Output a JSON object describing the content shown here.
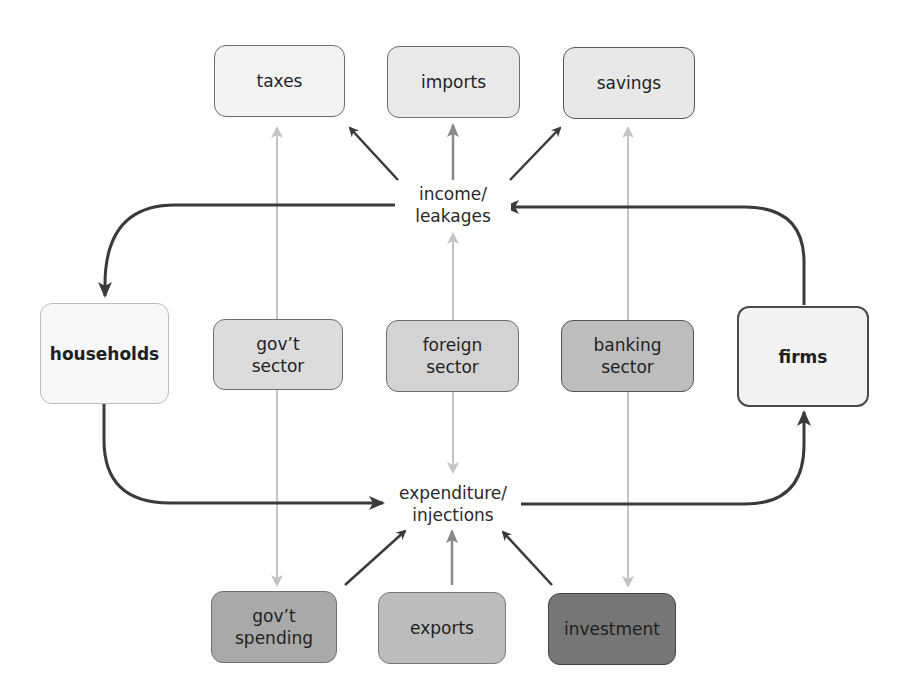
{
  "diagram": {
    "type": "circular-flow",
    "hubs": {
      "income": {
        "label": "income/\nleakages"
      },
      "expenditure": {
        "label": "expenditure/\ninjections"
      }
    },
    "agents": {
      "households": {
        "label": "households",
        "fill": "#f7f7f7",
        "border": "#bdbdbd"
      },
      "firms": {
        "label": "firms",
        "fill": "#f2f2f2",
        "border": "#4a4a4a"
      }
    },
    "leakages": [
      {
        "id": "taxes",
        "label": "taxes",
        "fill": "#f3f3f3"
      },
      {
        "id": "imports",
        "label": "imports",
        "fill": "#e9e9e9"
      },
      {
        "id": "savings",
        "label": "savings",
        "fill": "#e8e8e8"
      }
    ],
    "sectors": [
      {
        "id": "govt",
        "label": "gov’t\nsector",
        "fill": "#dcdcdc"
      },
      {
        "id": "foreign",
        "label": "foreign\nsector",
        "fill": "#d3d3d3"
      },
      {
        "id": "banking",
        "label": "banking\nsector",
        "fill": "#bdbdbd"
      }
    ],
    "injections": [
      {
        "id": "govt_spending",
        "label": "gov’t\nspending",
        "fill": "#a9a9a9"
      },
      {
        "id": "exports",
        "label": "exports",
        "fill": "#bcbcbc"
      },
      {
        "id": "investment",
        "label": "investment",
        "fill": "#767676"
      }
    ],
    "colors": {
      "main_flow": "#3a3a3a",
      "mid_arrow": "#8a8a8a",
      "dashed": "#c4c4c4"
    }
  }
}
